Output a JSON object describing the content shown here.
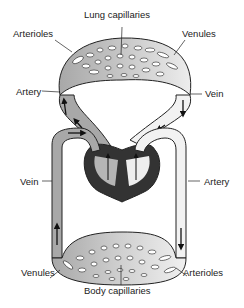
{
  "diagram": {
    "type": "circulatory-system",
    "labels": {
      "lung_capillaries": "Lung capillaries",
      "arterioles_top": "Arterioles",
      "venules_top": "Venules",
      "artery_left": "Artery",
      "vein_right": "Vein",
      "vein_left": "Vein",
      "artery_right": "Artery",
      "venules_bottom": "Venules",
      "arterioles_bottom": "Arterioles",
      "body_capillaries": "Body capillaries"
    },
    "colors": {
      "deoxygenated": "#a8a8a8",
      "oxygenated": "#f2f2f2",
      "heart_wall": "#333333",
      "outline": "#222222",
      "background": "#ffffff"
    }
  }
}
